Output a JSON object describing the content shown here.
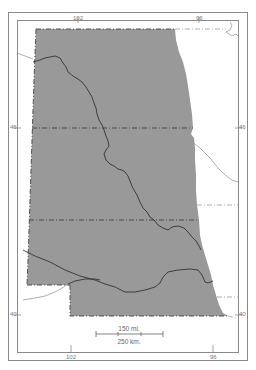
{
  "map": {
    "colors": {
      "region_fill": "#999999",
      "background": "#ffffff",
      "frame": "#888888",
      "border_dash": "#444444",
      "river": "#333333",
      "outside_lines": "#9a9a9a"
    },
    "longitude_labels": {
      "top": [
        "102",
        "96"
      ],
      "bottom": [
        "102",
        "96"
      ]
    },
    "latitude_labels": {
      "left": [
        "46",
        "40"
      ],
      "right": [
        "46",
        "40"
      ]
    },
    "scale_bar": {
      "miles_label": "150 mi.",
      "km_label": "250 km."
    }
  }
}
